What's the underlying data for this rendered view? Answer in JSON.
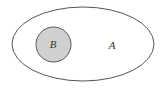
{
  "diagram": {
    "type": "venn-subset",
    "sets": [
      {
        "name": "A",
        "label": "A",
        "shape": "ellipse",
        "fill": "#ffffff",
        "stroke": "#555555"
      },
      {
        "name": "B",
        "label": "B",
        "shape": "circle",
        "fill": "#d0d0d0",
        "stroke": "#555555",
        "subset_of": "A"
      }
    ]
  }
}
